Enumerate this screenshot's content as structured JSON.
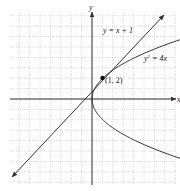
{
  "figure": {
    "axes": {
      "x_label": "x",
      "y_label": "y",
      "x_range": [
        -8,
        8
      ],
      "y_range": [
        -8,
        8
      ],
      "grid": true
    },
    "curves": [
      {
        "name": "line",
        "equation": "y = x + 1"
      },
      {
        "name": "parabola",
        "equation_base": "y",
        "equation_exp": "2",
        "equation_rest": " = 4x"
      }
    ],
    "points": [
      {
        "label": "(1, 2)",
        "x": 1,
        "y": 2
      }
    ],
    "colors": {
      "grid": "#bdbdbd",
      "axis": "#333333",
      "curve": "#333333"
    }
  },
  "chart_data": {
    "type": "line",
    "title": "",
    "xlabel": "x",
    "ylabel": "y",
    "xlim": [
      -8,
      8
    ],
    "ylim": [
      -8,
      8
    ],
    "grid": true,
    "series": [
      {
        "name": "y = x + 1",
        "x": [
          -7.5,
          7.5
        ],
        "y": [
          -6.5,
          8.5
        ]
      },
      {
        "name": "y^2 = 4x (upper)",
        "x": [
          0,
          0.25,
          1,
          2.25,
          4,
          6.25,
          9
        ],
        "y": [
          0,
          1,
          2,
          3,
          4,
          5,
          6
        ]
      },
      {
        "name": "y^2 = 4x (lower)",
        "x": [
          0,
          0.25,
          1,
          2.25,
          4,
          6.25,
          9
        ],
        "y": [
          0,
          -1,
          -2,
          -3,
          -4,
          -5,
          -6
        ]
      }
    ],
    "annotations": [
      {
        "text": "(1, 2)",
        "x": 1,
        "y": 2
      },
      {
        "text": "y = x + 1"
      },
      {
        "text": "y² = 4x"
      }
    ]
  }
}
